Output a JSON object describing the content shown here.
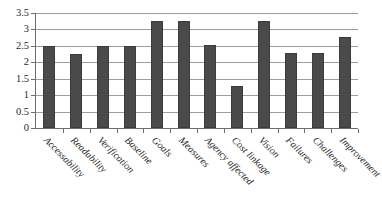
{
  "chart_data": {
    "type": "bar",
    "title": "",
    "subtitle": "",
    "xlabel": "",
    "ylabel": "",
    "ylim": [
      0,
      3.5
    ],
    "yticks": [
      0,
      0.5,
      1,
      1.5,
      2,
      2.5,
      3,
      3.5
    ],
    "ytick_labels": [
      "0",
      "0.5",
      "1",
      "1.5",
      "2",
      "2.5",
      "3",
      "3.5"
    ],
    "grid": true,
    "legend": false,
    "legend_position": "none",
    "bar_color": "#4a4a4a",
    "categories": [
      "Accessability",
      "Readability",
      "Verification",
      "Baseline",
      "Goals",
      "Measures",
      "Agency affected",
      "Cost linkage",
      "Vision",
      "Failures",
      "Challenges",
      "Improvement"
    ],
    "values": [
      2.5,
      2.25,
      2.5,
      2.5,
      3.25,
      3.25,
      2.52,
      1.27,
      3.26,
      2.27,
      2.27,
      2.78
    ]
  }
}
